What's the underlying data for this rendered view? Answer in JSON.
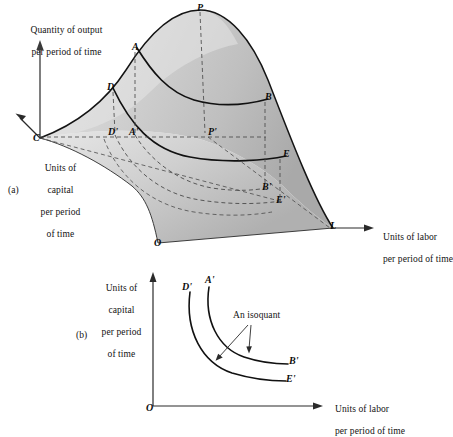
{
  "figure": {
    "background_color": "#ffffff",
    "ink_color": "#121212",
    "surface_fill_light": "#e8e8e8",
    "surface_fill_dark": "#9a9a9a"
  },
  "panel_a": {
    "tag": "(a)",
    "y_axis_label": "Quantity of output\nper period of time",
    "y_axis_label_line1": "Quantity of output",
    "y_axis_label_line2": "per period of time",
    "capital_axis_label_line1": "Units of",
    "capital_axis_label_line2": "capital",
    "capital_axis_label_line3": "per period",
    "capital_axis_label_line4": "of time",
    "labor_axis_label_line1": "Units of labor",
    "labor_axis_label_line2": "per period of time",
    "points": [
      {
        "id": "P",
        "label": "P",
        "x": 200,
        "y": 10,
        "kind": "surface-peak"
      },
      {
        "id": "A",
        "label": "A",
        "x": 137,
        "y": 48,
        "kind": "surface-ridge"
      },
      {
        "id": "D",
        "label": "D",
        "x": 113,
        "y": 88,
        "kind": "surface-ridge"
      },
      {
        "id": "B",
        "label": "B",
        "x": 268,
        "y": 99,
        "kind": "surface-ridge"
      },
      {
        "id": "E",
        "label": "E",
        "x": 286,
        "y": 156,
        "kind": "surface-ridge"
      },
      {
        "id": "C",
        "label": "C",
        "x": 40,
        "y": 138,
        "kind": "axis-origin-capital"
      },
      {
        "id": "O",
        "label": "O",
        "x": 158,
        "y": 244,
        "kind": "axis-origin"
      },
      {
        "id": "L",
        "label": "L",
        "x": 333,
        "y": 228,
        "kind": "axis-point-labor"
      },
      {
        "id": "Dp",
        "label": "D'",
        "x": 116,
        "y": 134,
        "kind": "base-projection"
      },
      {
        "id": "Ap",
        "label": "A'",
        "x": 137,
        "y": 134,
        "kind": "base-projection"
      },
      {
        "id": "Pp",
        "label": "P'",
        "x": 209,
        "y": 134,
        "kind": "base-projection"
      },
      {
        "id": "Bp",
        "label": "B'",
        "x": 265,
        "y": 189,
        "kind": "base-projection"
      },
      {
        "id": "Ep",
        "label": "E'",
        "x": 279,
        "y": 202,
        "kind": "base-projection"
      }
    ],
    "solid_contours": [
      {
        "name": "upper-isoquant-on-surface",
        "from": "A",
        "to": "B"
      },
      {
        "name": "lower-isoquant-on-surface",
        "from": "D",
        "to": "E"
      }
    ],
    "dashed_projections": [
      {
        "name": "projection-D-to-Dprime"
      },
      {
        "name": "projection-A-to-Aprime"
      },
      {
        "name": "projection-P-to-Pprime"
      },
      {
        "name": "projection-B-to-Bprime"
      },
      {
        "name": "projection-E-to-Eprime"
      },
      {
        "name": "base-isoquant-Dprime-Eprime"
      },
      {
        "name": "base-isoquant-Aprime-Bprime"
      },
      {
        "name": "base-line-C-to-Pprime"
      },
      {
        "name": "base-line-Pprime-to-L"
      }
    ]
  },
  "panel_b": {
    "tag": "(b)",
    "capital_axis_label_line1": "Units of",
    "capital_axis_label_line2": "capital",
    "capital_axis_label_line3": "per period",
    "capital_axis_label_line4": "of time",
    "labor_axis_label_line1": "Units of labor",
    "labor_axis_label_line2": "per period of time",
    "annotation": "An isoquant",
    "points": [
      {
        "id": "Dp",
        "label": "D'",
        "x": 186,
        "y": 288,
        "kind": "isoquant-endpoint-upper-left"
      },
      {
        "id": "Ap",
        "label": "A'",
        "x": 208,
        "y": 281,
        "kind": "isoquant-endpoint-upper-left"
      },
      {
        "id": "Bp",
        "label": "B'",
        "x": 292,
        "y": 362,
        "kind": "isoquant-endpoint-lower-right"
      },
      {
        "id": "Ep",
        "label": "E'",
        "x": 289,
        "y": 380,
        "kind": "isoquant-endpoint-lower-right"
      },
      {
        "id": "O",
        "label": "O",
        "x": 150,
        "y": 409,
        "kind": "axis-origin"
      }
    ],
    "isoquants": [
      {
        "name": "isoquant-DprimeEprime",
        "from": "D'",
        "to": "E'"
      },
      {
        "name": "isoquant-AprimeBprime",
        "from": "A'",
        "to": "B'"
      }
    ]
  }
}
